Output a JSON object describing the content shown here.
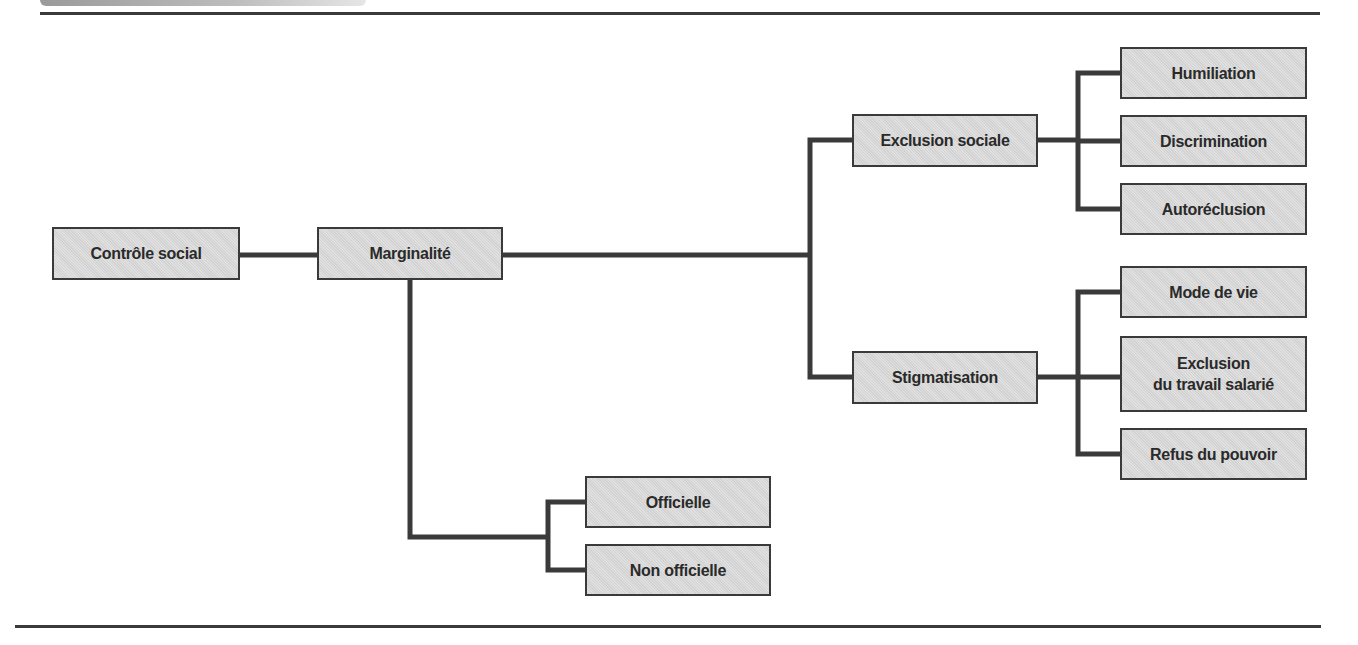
{
  "diagram": {
    "type": "tree",
    "root": "Contrôle social",
    "nodes": {
      "controle_social": {
        "label": "Contrôle social"
      },
      "marginalite": {
        "label": "Marginalité"
      },
      "exclusion_sociale": {
        "label": "Exclusion sociale"
      },
      "stigmatisation": {
        "label": "Stigmatisation"
      },
      "humiliation": {
        "label": "Humiliation"
      },
      "discrimination": {
        "label": "Discrimination"
      },
      "autoreclusion": {
        "label": "Autoréclusion"
      },
      "mode_de_vie": {
        "label": "Mode de vie"
      },
      "exclusion_travail": {
        "label_line1": "Exclusion",
        "label_line2": "du travail salarié"
      },
      "refus_pouvoir": {
        "label": "Refus du pouvoir"
      },
      "officielle": {
        "label": "Officielle"
      },
      "non_officielle": {
        "label": "Non officielle"
      }
    },
    "edges": [
      [
        "Contrôle social",
        "Marginalité"
      ],
      [
        "Marginalité",
        "Exclusion sociale"
      ],
      [
        "Marginalité",
        "Stigmatisation"
      ],
      [
        "Marginalité",
        "Officielle"
      ],
      [
        "Marginalité",
        "Non officielle"
      ],
      [
        "Exclusion sociale",
        "Humiliation"
      ],
      [
        "Exclusion sociale",
        "Discrimination"
      ],
      [
        "Exclusion sociale",
        "Autoréclusion"
      ],
      [
        "Stigmatisation",
        "Mode de vie"
      ],
      [
        "Stigmatisation",
        "Exclusion du travail salarié"
      ],
      [
        "Stigmatisation",
        "Refus du pouvoir"
      ]
    ],
    "colors": {
      "box_fill": "#d9d9d9",
      "line": "#3a3a3a",
      "text": "#2a2a2a"
    }
  }
}
